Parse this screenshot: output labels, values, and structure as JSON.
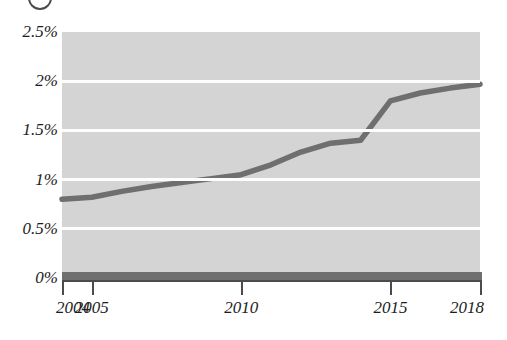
{
  "heading": {
    "badge": "circled-number-marker",
    "cropped_text": "— — — — — — — —"
  },
  "chart_data": {
    "type": "line",
    "title": "",
    "xlabel": "",
    "ylabel": "",
    "xlim": [
      2004,
      2018
    ],
    "ylim": [
      0,
      2.5
    ],
    "grid": true,
    "legend": false,
    "y_ticks": [
      2.5,
      2,
      1.5,
      1,
      0.5,
      0
    ],
    "y_tick_labels": [
      "2.5%",
      "2%",
      "1.5%",
      "1%",
      "0.5%",
      "0%"
    ],
    "x_ticks": [
      2004,
      2005,
      2010,
      2015,
      2018
    ],
    "x_tick_labels": [
      "2004",
      "2005",
      "2010",
      "2015",
      "2018"
    ],
    "x": [
      2004,
      2005,
      2006,
      2007,
      2008,
      2009,
      2010,
      2011,
      2012,
      2013,
      2014,
      2015,
      2016,
      2017,
      2018
    ],
    "values": [
      0.8,
      0.82,
      0.88,
      0.93,
      0.97,
      1.01,
      1.05,
      1.15,
      1.28,
      1.37,
      1.4,
      1.8,
      1.88,
      1.93,
      1.97
    ],
    "series": [
      {
        "name": "share",
        "values": [
          0.8,
          0.82,
          0.88,
          0.93,
          0.97,
          1.01,
          1.05,
          1.15,
          1.28,
          1.37,
          1.4,
          1.8,
          1.88,
          1.93,
          1.97
        ]
      }
    ],
    "colors": {
      "line": "#6f6f6f",
      "plot_background": "#d4d4d4",
      "gridline": "#fdfdfd",
      "axis": "#4b4b4b",
      "text": "#1d1d1d"
    }
  }
}
